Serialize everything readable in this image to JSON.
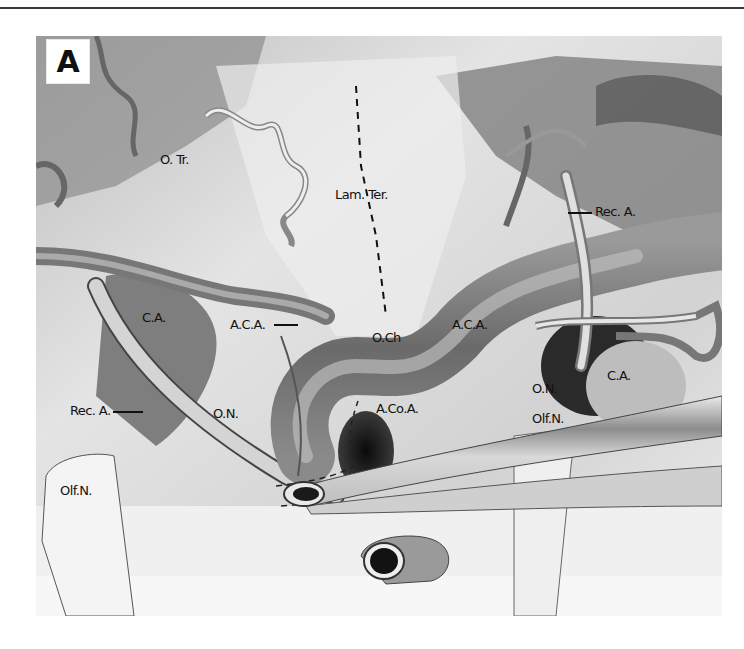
{
  "figure": {
    "panel_label": "A",
    "labels": {
      "optic_tract": "O. Tr.",
      "lamina_terminalis": "Lam. Ter.",
      "recurrent_artery_right": "Rec. A.",
      "carotid_artery_left": "C.A.",
      "anterior_cerebral_artery_left": "A.C.A.",
      "optic_chiasm": "O.Ch",
      "anterior_cerebral_artery_right": "A.C.A.",
      "anterior_communicating_artery": "A.Co.A.",
      "recurrent_artery_left": "Rec. A.",
      "optic_nerve_left": "O.N.",
      "optic_nerve_right": "O.N.",
      "carotid_artery_right": "C.A.",
      "olfactory_nerve_right": "Olf.N.",
      "olfactory_nerve_left": "Olf.N."
    }
  },
  "colors": {
    "background": "#ffffff",
    "rule": "#3a3a3a",
    "label_text": "#111111"
  }
}
